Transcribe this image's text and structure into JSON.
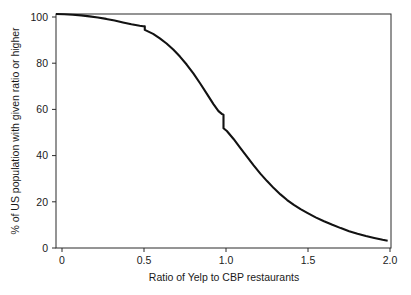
{
  "chart_data": {
    "type": "line",
    "title": "",
    "subtitle": "",
    "xlabel": "Ratio of Yelp to CBP restaurants",
    "ylabel": "% of US population with given ratio or higher",
    "xlim": [
      0,
      2.0
    ],
    "ylim": [
      0,
      100
    ],
    "xticks": [
      0,
      0.5,
      1.0,
      1.5,
      2.0
    ],
    "xticklabels": [
      "0",
      "0.5",
      "1.0",
      "1.5",
      "2.0"
    ],
    "yticks": [
      0,
      20,
      40,
      60,
      80,
      100
    ],
    "yticklabels": [
      "0",
      "20",
      "40",
      "60",
      "80",
      "100"
    ],
    "grid": false,
    "legend": null,
    "annotations": [],
    "series": [
      {
        "name": "Cumulative share of US population at or above ratio",
        "color": "#121212",
        "x": [
          0.0,
          0.05,
          0.1,
          0.15,
          0.2,
          0.25,
          0.3,
          0.35,
          0.4,
          0.45,
          0.5,
          0.52,
          0.53,
          0.53,
          0.58,
          0.62,
          0.66,
          0.7,
          0.74,
          0.78,
          0.82,
          0.86,
          0.9,
          0.94,
          0.97,
          0.99,
          1.0,
          1.0,
          1.02,
          1.06,
          1.1,
          1.14,
          1.18,
          1.22,
          1.26,
          1.3,
          1.34,
          1.38,
          1.42,
          1.46,
          1.5,
          1.55,
          1.6,
          1.65,
          1.7,
          1.75,
          1.8,
          1.85,
          1.9,
          1.95,
          1.98
        ],
        "y": [
          100.0,
          99.9,
          99.7,
          99.4,
          99.0,
          98.5,
          97.9,
          97.2,
          96.4,
          95.6,
          95.0,
          94.8,
          94.7,
          93.2,
          91.5,
          89.6,
          87.4,
          84.8,
          81.8,
          78.4,
          74.6,
          70.4,
          66.0,
          61.5,
          58.5,
          57.3,
          57.0,
          51.2,
          50.0,
          46.6,
          42.8,
          39.0,
          35.3,
          31.8,
          28.6,
          25.6,
          22.9,
          20.5,
          18.4,
          16.6,
          15.0,
          13.1,
          11.4,
          9.9,
          8.5,
          7.2,
          6.1,
          5.1,
          4.3,
          3.5,
          3.1
        ]
      }
    ],
    "notes": {
      "step_at_ratio_one": {
        "x": 1.0,
        "y_before": 57.0,
        "y_after": 51.2
      },
      "step_near_half": {
        "x": 0.53,
        "y_before": 94.7,
        "y_after": 93.2
      },
      "start_value": 100.0,
      "end_value": 3.1
    }
  },
  "layout": {
    "plot_left_px": 56,
    "plot_right_px": 391,
    "plot_top_px": 14,
    "plot_bottom_px": 248
  }
}
